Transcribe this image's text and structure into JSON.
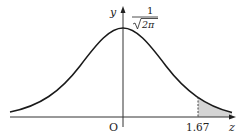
{
  "diagram": {
    "axes": {
      "x_label": "z",
      "y_label": "y",
      "origin_label": "O"
    },
    "peak_label": {
      "numerator": "1",
      "denominator": "√2π",
      "radicand": "2π"
    },
    "marker": {
      "value": "1.67",
      "style": "dashed vertical line"
    },
    "shaded_region": {
      "description": "area under curve for z ≥ 1.67",
      "fill_color": "#d4d4d4"
    },
    "colors": {
      "curve": "#1a1a1a",
      "axes": "#333333",
      "shade": "#d4d4d4"
    }
  }
}
